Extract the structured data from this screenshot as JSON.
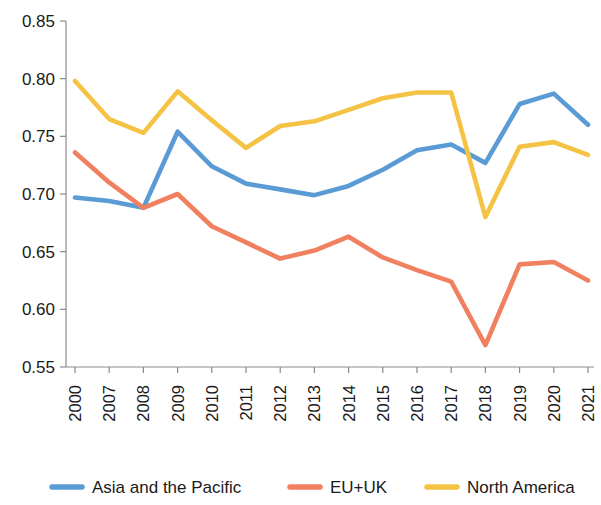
{
  "chart_data": {
    "type": "line",
    "title": "",
    "subtitle": "",
    "xlabel": "",
    "ylabel": "",
    "categories": [
      "2000",
      "2007",
      "2008",
      "2009",
      "2010",
      "2011",
      "2012",
      "2013",
      "2014",
      "2015",
      "2016",
      "2017",
      "2018",
      "2019",
      "2020",
      "2021"
    ],
    "ylim": [
      0.55,
      0.85
    ],
    "ytick_labels": [
      "0.85",
      "0.80",
      "0.75",
      "0.70",
      "0.65",
      "0.60",
      "0.55"
    ],
    "ytick_values": [
      0.85,
      0.8,
      0.75,
      0.7,
      0.65,
      0.6,
      0.55
    ],
    "grid": false,
    "legend_position": "bottom",
    "series": [
      {
        "name": "Asia and the Pacific",
        "color": "#5B9BD5",
        "values": [
          0.697,
          0.694,
          0.688,
          0.754,
          0.724,
          0.709,
          0.704,
          0.699,
          0.707,
          0.721,
          0.738,
          0.743,
          0.727,
          0.778,
          0.787,
          0.76
        ]
      },
      {
        "name": "EU+UK",
        "color": "#F08060",
        "values": [
          0.736,
          0.71,
          0.688,
          0.7,
          0.672,
          0.658,
          0.644,
          0.651,
          0.663,
          0.645,
          0.634,
          0.624,
          0.569,
          0.639,
          0.641,
          0.625
        ]
      },
      {
        "name": "North America",
        "color": "#F5C344",
        "values": [
          0.798,
          0.765,
          0.753,
          0.789,
          0.764,
          0.74,
          0.759,
          0.763,
          0.773,
          0.783,
          0.788,
          0.788,
          0.68,
          0.741,
          0.745,
          0.734
        ]
      }
    ]
  },
  "legend": {
    "items": [
      {
        "label": "Asia and the Pacific",
        "color": "#5B9BD5"
      },
      {
        "label": "EU+UK",
        "color": "#F08060"
      },
      {
        "label": "North America",
        "color": "#F5C344"
      }
    ]
  },
  "axes": {
    "y_min_label": "0.55",
    "y_max_label": "0.85"
  }
}
